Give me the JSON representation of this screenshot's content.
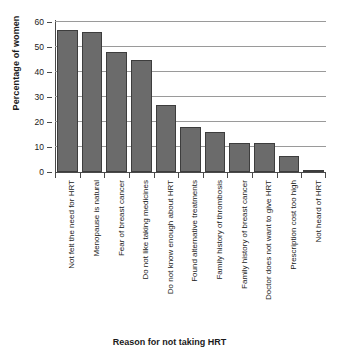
{
  "chart_data": {
    "type": "bar",
    "title": "",
    "xlabel": "Reason for not taking HRT",
    "ylabel": "Percentage of women",
    "ylim": [
      0,
      60
    ],
    "ytick_step": 10,
    "yticks": [
      0,
      10,
      20,
      30,
      40,
      50,
      60
    ],
    "ytick_labels": [
      "0",
      "10",
      "20",
      "30",
      "40",
      "50",
      "60"
    ],
    "grid": "horizontal",
    "legend": "none",
    "bar_color": "#6b6b6b",
    "bar_edge_color": "#3d3d3d",
    "axis_color": "#4a4a4a",
    "gridline_color": "#9a9a9a",
    "categories": [
      "Not felt the need for HRT",
      "Menopause is natural",
      "Fear of breast cancer",
      "Do not like taking medicines",
      "Do not know enough about HRT",
      "Found alternative treatments",
      "Family history of thrombosis",
      "Family history of breast cancer",
      "Doctor does not want to give HRT",
      "Prescription cost too high",
      "Not heard of HRT"
    ],
    "values": [
      57,
      56,
      48,
      45,
      27,
      18,
      16,
      11.5,
      11.5,
      6.5,
      1
    ]
  }
}
